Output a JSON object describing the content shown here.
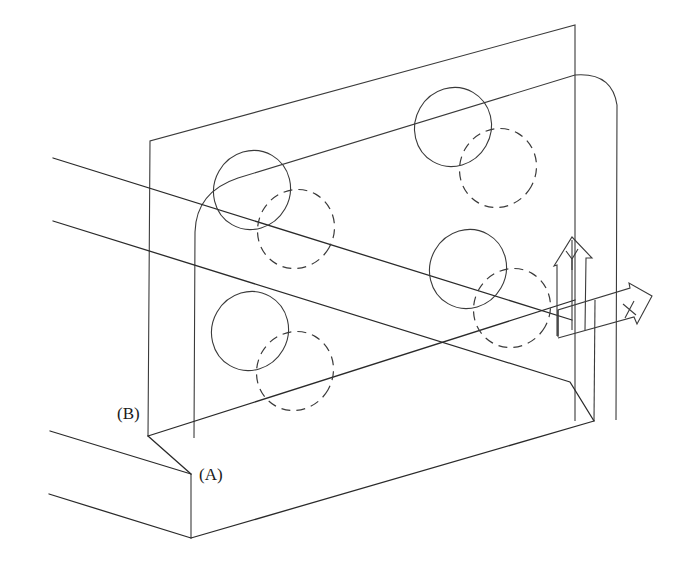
{
  "diagram": {
    "type": "isometric-technical-drawing",
    "labels": {
      "point_a": "(A)",
      "point_b": "(B)"
    },
    "ucs_icon": {
      "x_axis_label": "X",
      "y_axis_label": "Y"
    },
    "holes": [
      {
        "name": "upper-left",
        "visible": "solid",
        "hidden": "dashed"
      },
      {
        "name": "upper-right",
        "visible": "solid",
        "hidden": "dashed"
      },
      {
        "name": "lower-left",
        "visible": "solid",
        "hidden": "dashed"
      },
      {
        "name": "lower-right",
        "visible": "solid",
        "hidden": "dashed"
      }
    ],
    "colors": {
      "line": "#2a2a2a",
      "background": "#ffffff"
    }
  }
}
